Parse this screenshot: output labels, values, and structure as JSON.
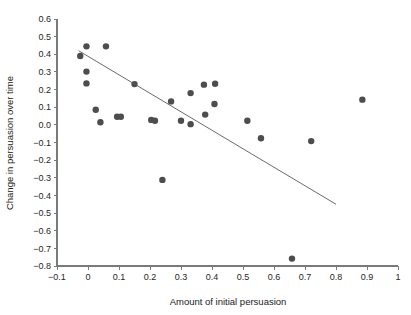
{
  "chart_data": {
    "type": "scatter",
    "title": "",
    "subtitle": "",
    "xlabel": "Amount of initial persuasion",
    "ylabel": "Change in persuasion over time",
    "xlim": [
      -0.1,
      1.0
    ],
    "ylim": [
      -0.8,
      0.6
    ],
    "xticks": [
      -0.1,
      0,
      0.1,
      0.2,
      0.3,
      0.4,
      0.5,
      0.6,
      0.7,
      0.8,
      0.9,
      1
    ],
    "xticklabels": [
      "−0.1",
      "0",
      "0.1",
      "0.2",
      "0.3",
      "0.4",
      "0.5",
      "0.6",
      "0.7",
      "0.8",
      "0.9",
      "1"
    ],
    "yticks": [
      0.6,
      0.5,
      0.4,
      0.3,
      0.2,
      0.1,
      0.0,
      -0.1,
      -0.2,
      -0.3,
      -0.4,
      -0.5,
      -0.6,
      -0.7,
      -0.8
    ],
    "yticklabels": [
      "0.6",
      "0.5",
      "0.4",
      "0.3",
      "0.2",
      "0.1",
      "0.0",
      "−0.1",
      "−0.2",
      "−0.3",
      "−0.4",
      "−0.5",
      "−0.6",
      "−0.7",
      "−0.8"
    ],
    "grid": false,
    "legend": false,
    "marker": "circle",
    "marker_color": "#4d4d4d",
    "marker_size": 3.2,
    "points": [
      {
        "x": -0.025,
        "y": 0.39
      },
      {
        "x": -0.005,
        "y": 0.445
      },
      {
        "x": -0.005,
        "y": 0.302
      },
      {
        "x": -0.005,
        "y": 0.235
      },
      {
        "x": 0.058,
        "y": 0.445
      },
      {
        "x": 0.025,
        "y": 0.086
      },
      {
        "x": 0.04,
        "y": 0.015
      },
      {
        "x": 0.094,
        "y": 0.046
      },
      {
        "x": 0.106,
        "y": 0.046
      },
      {
        "x": 0.15,
        "y": 0.231
      },
      {
        "x": 0.204,
        "y": 0.028
      },
      {
        "x": 0.216,
        "y": 0.023
      },
      {
        "x": 0.24,
        "y": -0.312
      },
      {
        "x": 0.268,
        "y": 0.133
      },
      {
        "x": 0.3,
        "y": 0.023
      },
      {
        "x": 0.331,
        "y": 0.004
      },
      {
        "x": 0.331,
        "y": 0.18
      },
      {
        "x": 0.374,
        "y": 0.228
      },
      {
        "x": 0.378,
        "y": 0.058
      },
      {
        "x": 0.41,
        "y": 0.233
      },
      {
        "x": 0.408,
        "y": 0.118
      },
      {
        "x": 0.514,
        "y": 0.023
      },
      {
        "x": 0.558,
        "y": -0.076
      },
      {
        "x": 0.658,
        "y": -0.758
      },
      {
        "x": 0.72,
        "y": -0.092
      },
      {
        "x": 0.885,
        "y": 0.143
      }
    ],
    "fit_line": {
      "type": "linear-regression",
      "color": "#595959",
      "x_start": -0.03,
      "y_start": 0.42,
      "x_end": 0.8,
      "y_end": -0.45
    }
  }
}
